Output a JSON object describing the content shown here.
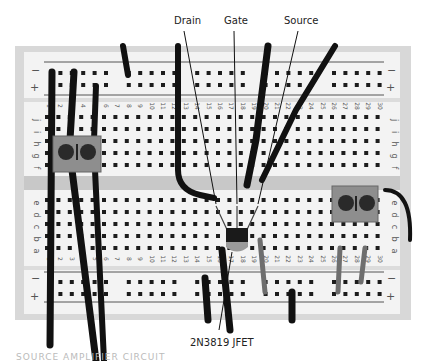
{
  "figure": {
    "annotations": {
      "drain": "Drain",
      "gate": "Gate",
      "source": "Source",
      "part": "2N3819 JFET"
    },
    "faded_caption": "SOURCE AMPLIFIER CIRCUIT"
  },
  "breadboard": {
    "columns": 30,
    "top_rows": [
      "j",
      "i",
      "h",
      "g",
      "f"
    ],
    "bottom_rows": [
      "e",
      "d",
      "c",
      "b",
      "a"
    ],
    "rail_top": {
      "minus": "−",
      "plus": "+"
    },
    "rail_bottom": {
      "minus": "−",
      "plus": "+"
    },
    "colors": {
      "board": "#f2f2f2",
      "frame": "#d6d6d6",
      "hole": "#1c1c1c",
      "wire": "#111111",
      "channel": "#c9c9c9"
    }
  }
}
